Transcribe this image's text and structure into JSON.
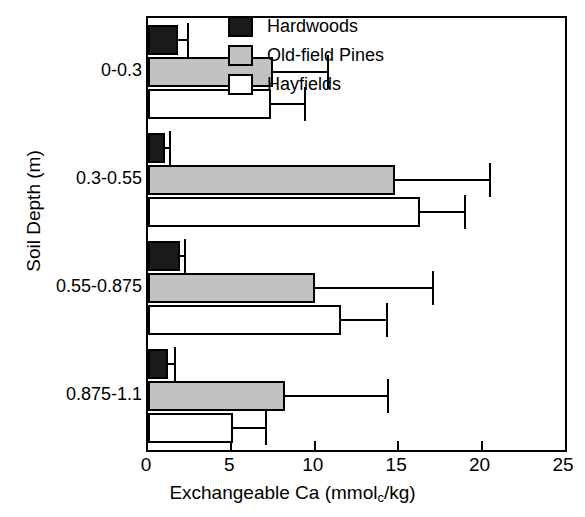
{
  "chart_data": {
    "type": "bar",
    "orientation": "horizontal",
    "title": "",
    "xlabel": "Exchangeable Ca (mmol_c/kg)",
    "xlabel_parts": {
      "pre": "Exchangeable Ca (mmol",
      "sub": "c",
      "post": "/kg)"
    },
    "ylabel": "Soil Depth (m)",
    "xlim": [
      0,
      25
    ],
    "xticks": [
      0,
      5,
      10,
      15,
      20,
      25
    ],
    "xticklabels": [
      "0",
      "5",
      "10",
      "15",
      "20",
      "25"
    ],
    "grid": false,
    "legend_position": "top-right",
    "categories": [
      "0-0.3",
      "0.3-0.55",
      "0.55-0.875",
      "0.875-1.1"
    ],
    "series": [
      {
        "name": "Hardwoods",
        "color": "#1a1a1a",
        "values": [
          1.8,
          1.0,
          1.9,
          1.2
        ],
        "errors": [
          0.6,
          0.3,
          0.3,
          0.4
        ]
      },
      {
        "name": "Old-field Pines",
        "color": "#c2c2c2",
        "values": [
          7.5,
          14.8,
          10.0,
          8.2
        ],
        "errors": [
          3.3,
          5.7,
          7.1,
          6.2
        ]
      },
      {
        "name": "Hayfields",
        "color": "#ffffff",
        "values": [
          7.4,
          16.3,
          11.6,
          5.1
        ],
        "errors": [
          2.0,
          2.7,
          2.7,
          2.0
        ]
      }
    ]
  },
  "legend": {
    "items": [
      {
        "label": "Hardwoods",
        "swatch": "hardwoods"
      },
      {
        "label": "Old-field Pines",
        "swatch": "pines"
      },
      {
        "label": "Hayfields",
        "swatch": "hayfields"
      }
    ]
  }
}
